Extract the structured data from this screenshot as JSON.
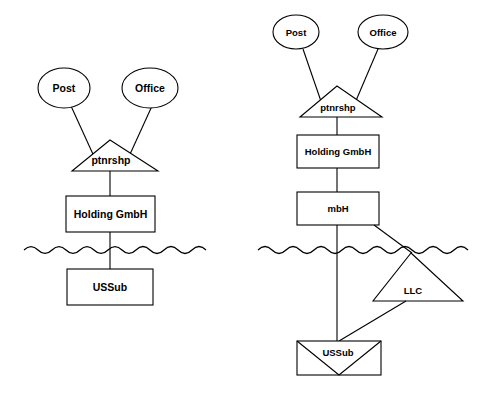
{
  "figure": {
    "background_color": "#ffffff",
    "stroke_color": "#000000",
    "diagrams": [
      {
        "id": "left-structure",
        "name": "left-diagram",
        "nodes": {
          "post": "Post",
          "office": "Office",
          "ptnrshp": "ptnrshp",
          "holding": "Holding GmbH",
          "ussub": "USSub"
        },
        "border_label": ""
      },
      {
        "id": "right-structure",
        "name": "right-diagram",
        "nodes": {
          "post": "Post",
          "office": "Office",
          "ptnrshp": "ptnrshp",
          "holding": "Holding GmbH",
          "mbh": "mbH",
          "llc": "LLC",
          "ussub": "USSub"
        },
        "border_label": ""
      }
    ]
  }
}
